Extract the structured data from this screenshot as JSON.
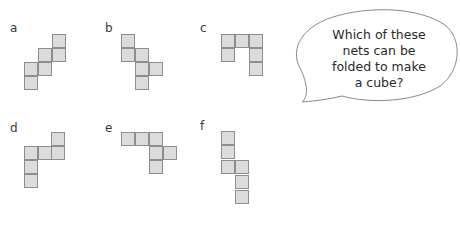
{
  "colors": {
    "square_fill": "#dcdcdc",
    "square_border": "#8e8e8e",
    "text": "#2a2a2a",
    "bubble_stroke": "#8a8a8a"
  },
  "nets": [
    {
      "label": "a",
      "label_pos": [
        10,
        22
      ],
      "cells": [
        [
          52,
          34
        ],
        [
          52,
          48
        ],
        [
          38,
          48
        ],
        [
          38,
          62
        ],
        [
          24,
          62
        ],
        [
          24,
          76
        ]
      ]
    },
    {
      "label": "b",
      "label_pos": [
        105,
        22
      ],
      "cells": [
        [
          121,
          34
        ],
        [
          121,
          48
        ],
        [
          135,
          48
        ],
        [
          135,
          62
        ],
        [
          149,
          62
        ],
        [
          135,
          76
        ]
      ]
    },
    {
      "label": "c",
      "label_pos": [
        200,
        22
      ],
      "cells": [
        [
          221,
          34
        ],
        [
          235,
          34
        ],
        [
          249,
          34
        ],
        [
          221,
          48
        ],
        [
          249,
          48
        ],
        [
          249,
          62
        ]
      ]
    },
    {
      "label": "d",
      "label_pos": [
        10,
        122
      ],
      "cells": [
        [
          51,
          132
        ],
        [
          24,
          146
        ],
        [
          38,
          146
        ],
        [
          51,
          146
        ],
        [
          24,
          160
        ],
        [
          24,
          174
        ]
      ]
    },
    {
      "label": "e",
      "label_pos": [
        105,
        122
      ],
      "cells": [
        [
          121,
          132
        ],
        [
          135,
          132
        ],
        [
          149,
          132
        ],
        [
          149,
          146
        ],
        [
          163,
          146
        ],
        [
          149,
          160
        ]
      ]
    },
    {
      "label": "f",
      "label_pos": [
        200,
        120
      ],
      "cells": [
        [
          221,
          131
        ],
        [
          221,
          145
        ],
        [
          221,
          160
        ],
        [
          235,
          160
        ],
        [
          235,
          175
        ],
        [
          235,
          190
        ]
      ]
    }
  ],
  "speech_bubble": {
    "lines": [
      "Which of these",
      "nets can be",
      "folded to make",
      "a cube?"
    ]
  }
}
